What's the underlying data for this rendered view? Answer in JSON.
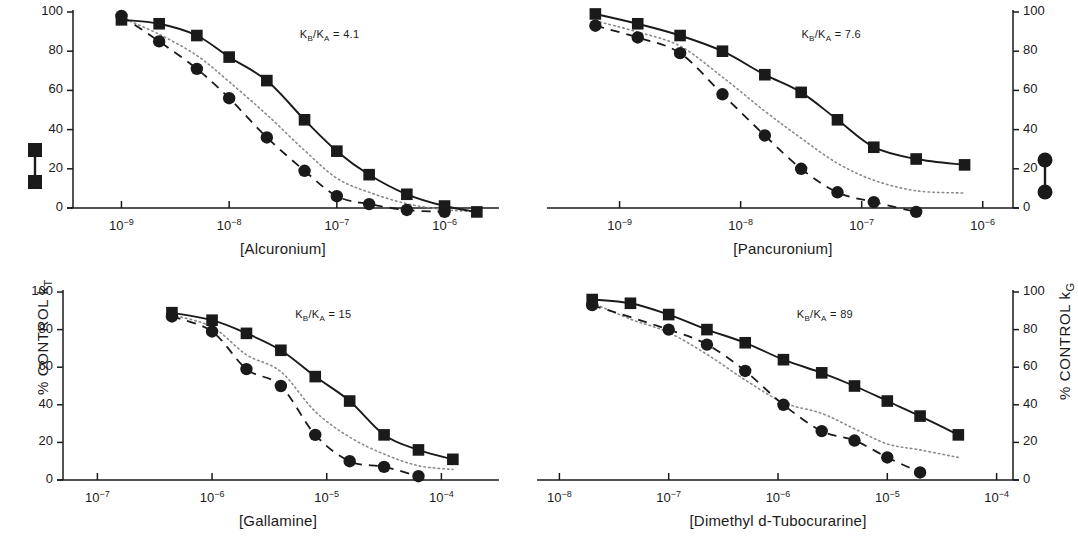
{
  "figure": {
    "left_axis_title": "% CONTROL k",
    "left_axis_sub": "T",
    "right_axis_title": "% CONTROL k",
    "right_axis_sub": "G",
    "legend_left_name": "filled-square-marker",
    "legend_right_name": "filled-circle-marker",
    "ink": "#1a1a1a",
    "dotted_color": "#8a8a8a"
  },
  "chart_data": {
    "type": "line",
    "title": "",
    "panel_layout": "2x2",
    "ylabel_left": "% CONTROL kT",
    "ylabel_right": "% CONTROL kG",
    "ylim": [
      0,
      100
    ],
    "yticks": [
      0,
      20,
      40,
      60,
      80,
      100
    ],
    "grid": false,
    "legend_position": "outside-left-and-right",
    "legend": [
      {
        "name": "% CONTROL kT",
        "marker": "square",
        "line": "solid"
      },
      {
        "name": "% CONTROL kG",
        "marker": "circle",
        "line": "dashed"
      },
      {
        "name": "predicted",
        "marker": "none",
        "line": "dotted"
      }
    ],
    "panels": [
      {
        "id": "alcuronium",
        "xlabel": "[Alcuronium]",
        "annotation": "K<sub>B</sub>/K<sub>A</sub> = 4.1",
        "annotation_text": "KB/KA = 4.1",
        "xticks": [
          "10⁻⁹",
          "10⁻⁸",
          "10⁻⁷",
          "10⁻⁶"
        ],
        "xtick_exponents": [
          -9,
          -8,
          -7,
          -6
        ],
        "xlim": [
          -9.45,
          -5.55
        ],
        "ytick_labels_side": "left",
        "series": [
          {
            "name": "kT",
            "marker": "square",
            "line": "solid",
            "points": [
              {
                "x": -9.0,
                "y": 96
              },
              {
                "x": -8.65,
                "y": 94
              },
              {
                "x": -8.3,
                "y": 88
              },
              {
                "x": -8.0,
                "y": 77
              },
              {
                "x": -7.65,
                "y": 65
              },
              {
                "x": -7.3,
                "y": 45
              },
              {
                "x": -7.0,
                "y": 29
              },
              {
                "x": -6.7,
                "y": 17
              },
              {
                "x": -6.35,
                "y": 7
              },
              {
                "x": -6.0,
                "y": 1
              },
              {
                "x": -5.7,
                "y": -2
              }
            ]
          },
          {
            "name": "kG",
            "marker": "circle",
            "line": "dashed",
            "points": [
              {
                "x": -9.0,
                "y": 98
              },
              {
                "x": -8.65,
                "y": 85
              },
              {
                "x": -8.3,
                "y": 71
              },
              {
                "x": -8.0,
                "y": 56
              },
              {
                "x": -7.65,
                "y": 36
              },
              {
                "x": -7.3,
                "y": 19
              },
              {
                "x": -7.0,
                "y": 6
              },
              {
                "x": -6.7,
                "y": 2
              },
              {
                "x": -6.35,
                "y": -1
              },
              {
                "x": -6.0,
                "y": -2
              }
            ]
          }
        ]
      },
      {
        "id": "pancuronium",
        "xlabel": "[Pancuronium]",
        "annotation": "K<sub>B</sub>/K<sub>A</sub> = 7.6",
        "annotation_text": "KB/KA = 7.6",
        "xticks": [
          "10⁻⁹",
          "10⁻⁸",
          "10⁻⁷",
          "10⁻⁶"
        ],
        "xtick_exponents": [
          -9,
          -8,
          -7,
          -6
        ],
        "xlim": [
          -9.55,
          -5.75
        ],
        "ytick_labels_side": "right",
        "series": [
          {
            "name": "kT",
            "marker": "square",
            "line": "solid",
            "points": [
              {
                "x": -9.2,
                "y": 99
              },
              {
                "x": -8.85,
                "y": 94
              },
              {
                "x": -8.5,
                "y": 88
              },
              {
                "x": -8.15,
                "y": 80
              },
              {
                "x": -7.8,
                "y": 68
              },
              {
                "x": -7.5,
                "y": 59
              },
              {
                "x": -7.2,
                "y": 45
              },
              {
                "x": -6.9,
                "y": 31
              },
              {
                "x": -6.55,
                "y": 25
              },
              {
                "x": -6.15,
                "y": 22
              }
            ]
          },
          {
            "name": "kG",
            "marker": "circle",
            "line": "dashed",
            "points": [
              {
                "x": -9.2,
                "y": 93
              },
              {
                "x": -8.85,
                "y": 87
              },
              {
                "x": -8.5,
                "y": 79
              },
              {
                "x": -8.15,
                "y": 58
              },
              {
                "x": -7.8,
                "y": 37
              },
              {
                "x": -7.5,
                "y": 20
              },
              {
                "x": -7.2,
                "y": 8
              },
              {
                "x": -6.9,
                "y": 3
              },
              {
                "x": -6.55,
                "y": -2
              }
            ]
          }
        ]
      },
      {
        "id": "gallamine",
        "xlabel": "[Gallamine]",
        "annotation": "K<sub>B</sub>/K<sub>A</sub> = 15",
        "annotation_text": "KB/KA = 15",
        "xticks": [
          "10⁻⁷",
          "10⁻⁶",
          "10⁻⁵",
          "10⁻⁴"
        ],
        "xtick_exponents": [
          -7,
          -6,
          -5,
          -4
        ],
        "xlim": [
          -7.3,
          -3.55
        ],
        "ytick_labels_side": "left",
        "series": [
          {
            "name": "kT",
            "marker": "square",
            "line": "solid",
            "points": [
              {
                "x": -6.35,
                "y": 89
              },
              {
                "x": -6.0,
                "y": 85
              },
              {
                "x": -5.7,
                "y": 78
              },
              {
                "x": -5.4,
                "y": 69
              },
              {
                "x": -5.1,
                "y": 55
              },
              {
                "x": -4.8,
                "y": 42
              },
              {
                "x": -4.5,
                "y": 24
              },
              {
                "x": -4.2,
                "y": 16
              },
              {
                "x": -3.9,
                "y": 11
              }
            ]
          },
          {
            "name": "kG",
            "marker": "circle",
            "line": "dashed",
            "points": [
              {
                "x": -6.35,
                "y": 87
              },
              {
                "x": -6.0,
                "y": 79
              },
              {
                "x": -5.7,
                "y": 59
              },
              {
                "x": -5.4,
                "y": 50
              },
              {
                "x": -5.1,
                "y": 24
              },
              {
                "x": -4.8,
                "y": 10
              },
              {
                "x": -4.5,
                "y": 7
              },
              {
                "x": -4.2,
                "y": 2
              }
            ]
          }
        ]
      },
      {
        "id": "dimethyl-d-tubocurarine",
        "xlabel": "[Dimethyl d-Tubocurarine]",
        "annotation": "K<sub>B</sub>/K<sub>A</sub> = 89",
        "annotation_text": "KB/KA = 89",
        "xticks": [
          "10⁻⁸",
          "10⁻⁷",
          "10⁻⁶",
          "10⁻⁵",
          "10⁻⁴"
        ],
        "xtick_exponents": [
          -8,
          -7,
          -6,
          -5,
          -4
        ],
        "xlim": [
          -8.15,
          -3.85
        ],
        "ytick_labels_side": "right",
        "series": [
          {
            "name": "kT",
            "marker": "square",
            "line": "solid",
            "points": [
              {
                "x": -7.7,
                "y": 96
              },
              {
                "x": -7.35,
                "y": 94
              },
              {
                "x": -7.0,
                "y": 88
              },
              {
                "x": -6.65,
                "y": 80
              },
              {
                "x": -6.3,
                "y": 73
              },
              {
                "x": -5.95,
                "y": 64
              },
              {
                "x": -5.6,
                "y": 57
              },
              {
                "x": -5.3,
                "y": 50
              },
              {
                "x": -5.0,
                "y": 42
              },
              {
                "x": -4.7,
                "y": 34
              },
              {
                "x": -4.35,
                "y": 24
              }
            ]
          },
          {
            "name": "kG",
            "marker": "circle",
            "line": "dashed",
            "points": [
              {
                "x": -7.7,
                "y": 93
              },
              {
                "x": -7.0,
                "y": 80
              },
              {
                "x": -6.65,
                "y": 72
              },
              {
                "x": -6.3,
                "y": 58
              },
              {
                "x": -5.95,
                "y": 40
              },
              {
                "x": -5.6,
                "y": 26
              },
              {
                "x": -5.3,
                "y": 21
              },
              {
                "x": -5.0,
                "y": 12
              },
              {
                "x": -4.7,
                "y": 4
              }
            ]
          }
        ]
      }
    ]
  }
}
